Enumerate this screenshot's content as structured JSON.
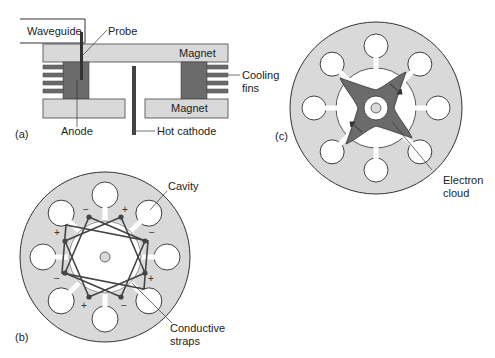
{
  "figure": {
    "panels": [
      {
        "id": "a",
        "label": "(a)",
        "title": "Magnetron cross-section"
      },
      {
        "id": "b",
        "label": "(b)",
        "title": "Strapped anode block"
      },
      {
        "id": "c",
        "label": "(c)",
        "title": "Electron cloud rotating spokes"
      }
    ]
  },
  "panel_a": {
    "label": "(a)",
    "waveguide": "Waveguide",
    "probe": "Probe",
    "magnet_top": "Magnet",
    "magnet_bottom": "Magnet",
    "cooling_fins_line1": "Cooling",
    "cooling_fins_line2": "fins",
    "anode": "Anode",
    "hot_cathode": "Hot cathode"
  },
  "panel_b": {
    "label": "(b)",
    "cavity": "Cavity",
    "straps_line1": "Conductive",
    "straps_line2": "straps",
    "polarity": [
      "−",
      "+",
      "−",
      "+",
      "−",
      "+",
      "−",
      "+"
    ]
  },
  "panel_c": {
    "label": "(c)",
    "electron_line1": "Electron",
    "electron_line2": "cloud"
  },
  "colors": {
    "body_gray": "#d9d9d9",
    "dark_gray": "#6b6b6b",
    "outline": "#3a3a3a",
    "text": "#222222"
  }
}
